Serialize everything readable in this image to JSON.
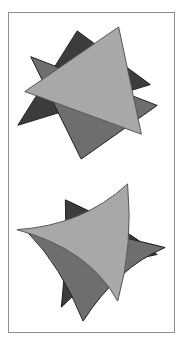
{
  "page": {
    "background_color": "#ffffff",
    "width": 185,
    "height": 344
  },
  "frame": {
    "name": "figure-frame",
    "border_color": "#8f8f8f",
    "fill_color": "#ffffff",
    "x": 8,
    "y": 12,
    "width": 167,
    "height": 321
  },
  "palette": {
    "light_gray": "#a8a8a8",
    "medium_gray": "#6e6e6e",
    "dark_gray": "#3c3c3c",
    "outline": "#1f1f1f",
    "outline_light": "#555555",
    "paper": "#ffffff"
  },
  "figures": [
    {
      "id": "upper-figure",
      "label": "Straight-edged six-point star from two overlapping triangles",
      "edge_style": "straight",
      "shapes": [
        {
          "name": "upper-dark-triangle",
          "fill": "#3c3c3c",
          "points": "74,28 147,78 18,120",
          "description": "Dark gray triangle pointing up-left, rendered behind"
        },
        {
          "name": "upper-medium-triangle",
          "fill": "#6e6e6e",
          "points": "30,52 140,100 70,152",
          "description": "Medium gray triangle pointing down, rendered in middle"
        },
        {
          "name": "upper-light-triangle",
          "fill": "#a8a8a8",
          "points": "113,24 137,122 22,85",
          "description": "Light gray large triangle, rendered on top"
        }
      ]
    },
    {
      "id": "lower-figure",
      "label": "Curved-edged star from two overlapping concave triangles",
      "edge_style": "curved-concave",
      "shapes": [
        {
          "name": "lower-dark-triangle",
          "fill": "#3c3c3c",
          "description": "Dark gray curved triangle pointing up-left, rendered behind"
        },
        {
          "name": "lower-medium-triangle",
          "fill": "#6e6e6e",
          "description": "Medium gray curved triangle pointing down, rendered in middle"
        },
        {
          "name": "lower-light-triangle",
          "fill": "#a8a8a8",
          "description": "Light gray large curved triangle, rendered on top"
        }
      ]
    }
  ]
}
